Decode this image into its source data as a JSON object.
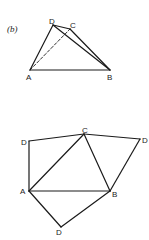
{
  "figures": [
    {
      "caption": "(b)",
      "points": {
        "A": {
          "label": "A",
          "x": 30,
          "y": 70
        },
        "B": {
          "label": "B",
          "x": 110,
          "y": 70
        },
        "C": {
          "label": "C",
          "x": 70,
          "y": 29
        },
        "D": {
          "label": "D",
          "x": 53,
          "y": 25
        }
      },
      "edges": [
        {
          "from": "A",
          "to": "B",
          "style": "solid"
        },
        {
          "from": "A",
          "to": "D",
          "style": "solid"
        },
        {
          "from": "D",
          "to": "C",
          "style": "solid"
        },
        {
          "from": "D",
          "to": "B",
          "style": "solid"
        },
        {
          "from": "C",
          "to": "B",
          "style": "solid"
        },
        {
          "from": "A",
          "to": "C",
          "style": "dashed"
        }
      ]
    },
    {
      "caption": "",
      "points": {
        "A": {
          "label": "A",
          "x": 29,
          "y": 191
        },
        "B": {
          "label": "B",
          "x": 110,
          "y": 191
        },
        "C": {
          "label": "C",
          "x": 84,
          "y": 134
        },
        "D1": {
          "label": "D",
          "x": 29,
          "y": 141
        },
        "D2": {
          "label": "D",
          "x": 140,
          "y": 139
        },
        "D3": {
          "label": "D",
          "x": 61,
          "y": 227
        }
      },
      "edges": [
        {
          "from": "A",
          "to": "B",
          "style": "solid"
        },
        {
          "from": "A",
          "to": "C",
          "style": "solid"
        },
        {
          "from": "C",
          "to": "B",
          "style": "solid"
        },
        {
          "from": "A",
          "to": "D1",
          "style": "solid"
        },
        {
          "from": "D1",
          "to": "C",
          "style": "solid"
        },
        {
          "from": "C",
          "to": "D2",
          "style": "solid"
        },
        {
          "from": "D2",
          "to": "B",
          "style": "solid"
        },
        {
          "from": "A",
          "to": "D3",
          "style": "solid"
        },
        {
          "from": "D3",
          "to": "B",
          "style": "solid"
        }
      ]
    }
  ]
}
